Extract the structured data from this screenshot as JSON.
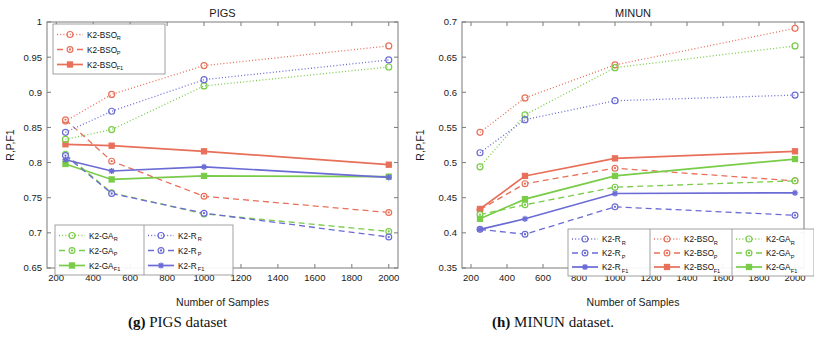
{
  "figure": {
    "caption_left_prefix": "(g)",
    "caption_left": " PIGS dataset",
    "caption_right_prefix": "(h)",
    "caption_right": " MINUN dataset."
  },
  "colors": {
    "red": "#e8705a",
    "blue": "#6b6bd6",
    "green": "#79cc48",
    "axis": "#7a7a7a",
    "text": "#1a1a1a",
    "background": "#ffffff"
  },
  "chart_data": [
    {
      "type": "line",
      "title": "PIGS",
      "xlabel": "Number of Samples",
      "ylabel": "R,P,F1",
      "x": [
        250,
        500,
        1000,
        2000
      ],
      "xlim": [
        150,
        2050
      ],
      "ylim": [
        0.65,
        1
      ],
      "xticks": [
        200,
        400,
        600,
        800,
        1000,
        1200,
        1400,
        1600,
        1800,
        2000
      ],
      "xticklabels": [
        "200",
        "400",
        "600",
        "800",
        "1000",
        "1200",
        "1400",
        "1600",
        "1800",
        "2000"
      ],
      "yticks": [
        0.65,
        0.7,
        0.75,
        0.8,
        0.85,
        0.9,
        0.95,
        1
      ],
      "yticklabels": [
        "0.65",
        "0.7",
        "0.75",
        "0.8",
        "0.85",
        "0.9",
        "0.95",
        "1"
      ],
      "grid": false,
      "series": [
        {
          "name": "K2-BSO_R",
          "label": "K2-BSO",
          "sub": "R",
          "color": "#e8705a",
          "style": "dotted",
          "marker": "circle",
          "values": [
            0.859,
            0.897,
            0.938,
            0.966
          ]
        },
        {
          "name": "K2-BSO_P",
          "label": "K2-BSO",
          "sub": "P",
          "color": "#e8705a",
          "style": "dashed",
          "marker": "circle-dot",
          "values": [
            0.861,
            0.802,
            0.752,
            0.729
          ]
        },
        {
          "name": "K2-BSO_F1",
          "label": "K2-BSO",
          "sub": "F1",
          "color": "#e8705a",
          "style": "solid",
          "marker": "square",
          "values": [
            0.826,
            0.824,
            0.816,
            0.797
          ]
        },
        {
          "name": "K2-GA_R",
          "label": "K2-GA",
          "sub": "R",
          "color": "#79cc48",
          "style": "dotted",
          "marker": "circle",
          "values": [
            0.833,
            0.847,
            0.909,
            0.936
          ]
        },
        {
          "name": "K2-GA_P",
          "label": "K2-GA",
          "sub": "P",
          "color": "#79cc48",
          "style": "dashed",
          "marker": "circle-dot",
          "values": [
            0.812,
            0.757,
            0.727,
            0.702
          ]
        },
        {
          "name": "K2-GA_F1",
          "label": "K2-GA",
          "sub": "F1",
          "color": "#79cc48",
          "style": "solid",
          "marker": "square",
          "values": [
            0.798,
            0.776,
            0.781,
            0.78
          ]
        },
        {
          "name": "K2-R_R",
          "label": "K2-R",
          "sub": "R",
          "color": "#6b6bd6",
          "style": "dotted",
          "marker": "circle",
          "values": [
            0.843,
            0.873,
            0.918,
            0.946
          ]
        },
        {
          "name": "K2-R_P",
          "label": "K2-R",
          "sub": "P",
          "color": "#6b6bd6",
          "style": "dashed",
          "marker": "circle-dot",
          "values": [
            0.81,
            0.756,
            0.728,
            0.694
          ]
        },
        {
          "name": "K2-R_F1",
          "label": "K2-R",
          "sub": "F1",
          "color": "#6b6bd6",
          "style": "solid",
          "marker": "star",
          "values": [
            0.804,
            0.788,
            0.794,
            0.779
          ]
        }
      ],
      "legends": [
        {
          "id": "legend-top",
          "entries": [
            "K2-BSO_R",
            "K2-BSO_P",
            "K2-BSO_F1"
          ],
          "cols": 1
        },
        {
          "id": "legend-bottom",
          "entries": [
            "K2-GA_R",
            "K2-GA_P",
            "K2-GA_F1",
            "K2-R_R",
            "K2-R_P",
            "K2-R_F1"
          ],
          "cols": 2
        }
      ]
    },
    {
      "type": "line",
      "title": "MINUN",
      "xlabel": "Number of Samples",
      "ylabel": "R,P,F1",
      "x": [
        250,
        500,
        1000,
        2000
      ],
      "xlim": [
        150,
        2050
      ],
      "ylim": [
        0.35,
        0.7
      ],
      "xticks": [
        200,
        400,
        600,
        800,
        1000,
        1200,
        1400,
        1600,
        1800,
        2000
      ],
      "xticklabels": [
        "200",
        "400",
        "600",
        "800",
        "1000",
        "1200",
        "1400",
        "1600",
        "1800",
        "2000"
      ],
      "yticks": [
        0.35,
        0.4,
        0.45,
        0.5,
        0.55,
        0.6,
        0.65,
        0.7
      ],
      "yticklabels": [
        "0.35",
        "0.4",
        "0.45",
        "0.5",
        "0.55",
        "0.6",
        "0.65",
        "0.7"
      ],
      "grid": false,
      "series": [
        {
          "name": "K2-BSO_R",
          "label": "K2-BSO",
          "sub": "R",
          "color": "#e8705a",
          "style": "dotted",
          "marker": "circle",
          "values": [
            0.543,
            0.592,
            0.639,
            0.691
          ]
        },
        {
          "name": "K2-BSO_P",
          "label": "K2-BSO",
          "sub": "P",
          "color": "#e8705a",
          "style": "dashed",
          "marker": "circle-dot",
          "values": [
            0.433,
            0.47,
            0.492,
            0.474
          ]
        },
        {
          "name": "K2-BSO_F1",
          "label": "K2-BSO",
          "sub": "F1",
          "color": "#e8705a",
          "style": "solid",
          "marker": "square",
          "values": [
            0.434,
            0.481,
            0.506,
            0.516
          ]
        },
        {
          "name": "K2-GA_R",
          "label": "K2-GA",
          "sub": "R",
          "color": "#79cc48",
          "style": "dotted",
          "marker": "circle",
          "values": [
            0.494,
            0.568,
            0.635,
            0.666
          ]
        },
        {
          "name": "K2-GA_P",
          "label": "K2-GA",
          "sub": "P",
          "color": "#79cc48",
          "style": "dashed",
          "marker": "circle-dot",
          "values": [
            0.426,
            0.44,
            0.465,
            0.474
          ]
        },
        {
          "name": "K2-GA_F1",
          "label": "K2-GA",
          "sub": "F1",
          "color": "#79cc48",
          "style": "solid",
          "marker": "square",
          "values": [
            0.42,
            0.448,
            0.481,
            0.505
          ]
        },
        {
          "name": "K2-R_R",
          "label": "K2-R",
          "sub": "R",
          "color": "#6b6bd6",
          "style": "dotted",
          "marker": "circle",
          "values": [
            0.514,
            0.561,
            0.588,
            0.596
          ]
        },
        {
          "name": "K2-R_P",
          "label": "K2-R",
          "sub": "P",
          "color": "#6b6bd6",
          "style": "dashed",
          "marker": "circle-dot",
          "values": [
            0.405,
            0.398,
            0.437,
            0.425
          ]
        },
        {
          "name": "K2-R_F1",
          "label": "K2-R",
          "sub": "F1",
          "color": "#6b6bd6",
          "style": "solid",
          "marker": "star",
          "values": [
            0.405,
            0.42,
            0.456,
            0.457
          ]
        }
      ],
      "legends": [
        {
          "id": "legend-bottom",
          "entries": [
            "K2-R_R",
            "K2-R_P",
            "K2-R_F1",
            "K2-BSO_R",
            "K2-BSO_P",
            "K2-BSO_F1",
            "K2-GA_R",
            "K2-GA_P",
            "K2-GA_F1"
          ],
          "cols": 3
        }
      ]
    }
  ]
}
